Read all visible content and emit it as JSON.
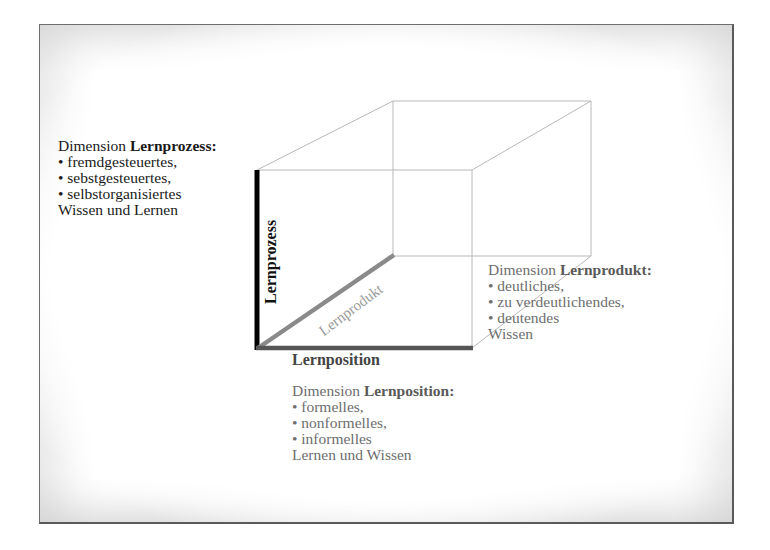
{
  "diagram": {
    "axes": {
      "vertical": {
        "label": "Lernprozess",
        "color": "#000000"
      },
      "diagonal": {
        "label": "Lernprodukt",
        "color": "#8a8a8a"
      },
      "horizontal": {
        "label": "Lernposition",
        "color": "#555555"
      }
    },
    "blocks": {
      "lernprozess": {
        "prefix": "Dimension ",
        "bold": "Lernprozess",
        "suffix": ":",
        "items": [
          "• fremdgesteuertes,",
          "• sebstgesteuertes,",
          "• selbstorganisiertes"
        ],
        "footer": "Wissen und Lernen"
      },
      "lernprodukt": {
        "prefix": "Dimension ",
        "bold": "Lernprodukt",
        "suffix": ":",
        "items": [
          "• deutliches,",
          "• zu verdeutlichendes,",
          "• deutendes"
        ],
        "footer": "Wissen"
      },
      "lernposition": {
        "prefix": "Dimension ",
        "bold": "Lernposition",
        "suffix": ":",
        "items": [
          "• formelles,",
          "• nonformelles,",
          "• informelles"
        ],
        "footer": "Lernen und Wissen"
      }
    },
    "colors": {
      "frame_border": "#6e6e6e",
      "frame_fill": "#cfcfcf",
      "cube_lines": "#b5b5b5"
    }
  }
}
